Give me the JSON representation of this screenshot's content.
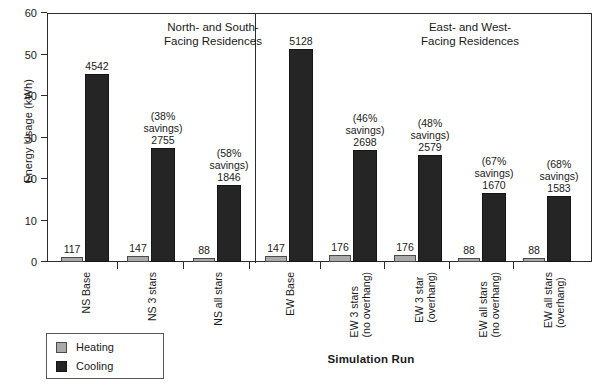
{
  "chart_data": {
    "type": "bar",
    "title": "",
    "xlabel": "Simulation Run",
    "ylabel": "Energy Usage (kWh)",
    "ylim": [
      0,
      60
    ],
    "ytick_values": [
      0,
      10,
      20,
      30,
      40,
      50,
      60
    ],
    "ytick_labels": [
      "0",
      "10",
      "20",
      "30",
      "40",
      "50",
      "60"
    ],
    "grid": false,
    "legend_position": "below-left",
    "value_scale_note": "bar value labels are in kWh; axis is scaled so 4542 kWh plots at ~45.4",
    "categories": [
      "NS Base",
      "NS 3 stars",
      "NS all stars",
      "EW Base",
      "EW 3 stars (no overhang)",
      "EW 3 star (overhang)",
      "EW all stars (no overhang)",
      "EW all stars (overhang)"
    ],
    "category_lines": [
      [
        "NS Base",
        ""
      ],
      [
        "NS 3 stars",
        ""
      ],
      [
        "NS all stars",
        ""
      ],
      [
        "EW Base",
        ""
      ],
      [
        "EW 3 stars",
        "(no overhang)"
      ],
      [
        "EW 3 star",
        "(overhang)"
      ],
      [
        "EW all stars",
        "(no overhang)"
      ],
      [
        "EW all stars",
        "(overhang)"
      ]
    ],
    "series": [
      {
        "name": "Heating",
        "color": "#a9a9a9",
        "values": [
          117,
          147,
          88,
          147,
          176,
          176,
          88,
          88
        ]
      },
      {
        "name": "Cooling",
        "color": "#252525",
        "values": [
          4542,
          2755,
          1846,
          5128,
          2698,
          2579,
          1670,
          1583
        ]
      }
    ],
    "annotations": {
      "savings_labels": [
        null,
        "(38%\nsavings)",
        "(58%\nsavings)",
        null,
        "(46%\nsavings)",
        "(48%\nsavings)",
        "(67%\nsavings)",
        "(68%\nsavings)"
      ],
      "savings_lines": [
        [
          "",
          ""
        ],
        [
          "(38%",
          "savings)"
        ],
        [
          "(58%",
          "savings)"
        ],
        [
          "",
          ""
        ],
        [
          "(46%",
          "savings)"
        ],
        [
          "(48%",
          "savings)"
        ],
        [
          "(67%",
          "savings)"
        ],
        [
          "(68%",
          "savings)"
        ]
      ],
      "groups": [
        {
          "line1": "North- and South-",
          "line2": "Facing Residences"
        },
        {
          "line1": "East- and West-",
          "line2": "Facing Residences"
        }
      ]
    }
  },
  "legend": {
    "items": [
      {
        "label": "Heating",
        "color": "#a9a9a9"
      },
      {
        "label": "Cooling",
        "color": "#252525"
      }
    ]
  },
  "axis": {
    "y_title": "Energy Usage (kWh)",
    "x_title": "Simulation Run"
  }
}
